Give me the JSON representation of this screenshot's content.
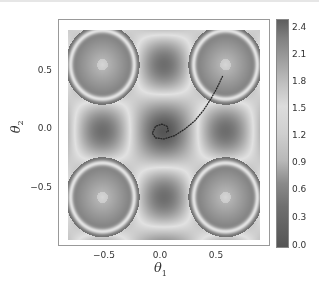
{
  "chart_data": {
    "type": "heatmap",
    "title": "",
    "xlabel": "θ1",
    "ylabel": "θ2",
    "xlim": [
      -0.9,
      0.9
    ],
    "ylim": [
      -0.95,
      0.88
    ],
    "x_ticks": [
      {
        "label": "−0.5",
        "value": -0.5
      },
      {
        "label": "0.0",
        "value": 0.0
      },
      {
        "label": "0.5",
        "value": 0.5
      }
    ],
    "y_ticks": [
      {
        "label": "0.5",
        "value": 0.5
      },
      {
        "label": "0.0",
        "value": 0.0
      },
      {
        "label": "−0.5",
        "value": -0.5
      }
    ],
    "colorbar": {
      "min": 0.0,
      "max": 2.45,
      "ticks": [
        "2.4",
        "2.1",
        "1.8",
        "1.5",
        "1.2",
        "0.9",
        "0.6",
        "0.3",
        "0.0"
      ],
      "colormap": "gray-diverging (dark low, light mid, dark high)"
    },
    "field_description": "Periodic loss landscape with dark minimum at (0,0), dark basins at edges (0,±0.9) and (±0.9,0), and local minima at (±0.58,±0.58) surrounded by light rings",
    "trajectory": {
      "description": "Optimization path starting near (0.55, 0.48) curving down-left and spiraling into (0.0, 0.0)",
      "points": [
        [
          0.55,
          0.48
        ],
        [
          0.5,
          0.38
        ],
        [
          0.44,
          0.28
        ],
        [
          0.37,
          0.18
        ],
        [
          0.29,
          0.09
        ],
        [
          0.2,
          0.02
        ],
        [
          0.1,
          -0.04
        ],
        [
          0.0,
          -0.07
        ],
        [
          -0.08,
          -0.06
        ],
        [
          -0.11,
          -0.02
        ],
        [
          -0.08,
          0.04
        ],
        [
          -0.02,
          0.06
        ],
        [
          0.03,
          0.04
        ],
        [
          0.04,
          0.0
        ],
        [
          0.02,
          -0.01
        ]
      ],
      "color": "#222222"
    }
  }
}
